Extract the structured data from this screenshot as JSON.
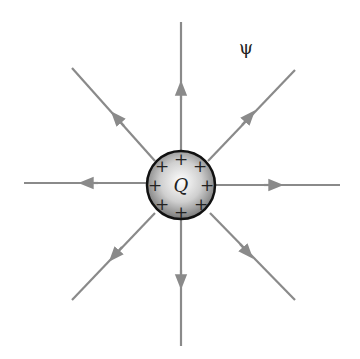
{
  "diagram": {
    "title": "",
    "flux_label": "ψ",
    "charge_label": "Q",
    "charge_signs": [
      "+",
      "+",
      "+",
      "+",
      "+",
      "+",
      "+",
      "+"
    ],
    "colors": {
      "field_line": "#8a8a8a",
      "sphere_outline": "#111111",
      "sphere_light": "#ffffff",
      "sphere_dark": "#7a7a7a",
      "text": "#222222"
    },
    "field_lines": [
      {
        "direction": "up",
        "arrow": "outward"
      },
      {
        "direction": "up-right",
        "arrow": "outward"
      },
      {
        "direction": "right",
        "arrow": "outward"
      },
      {
        "direction": "down-right",
        "arrow": "outward"
      },
      {
        "direction": "down",
        "arrow": "outward"
      },
      {
        "direction": "down-left",
        "arrow": "outward"
      },
      {
        "direction": "left",
        "arrow": "outward"
      },
      {
        "direction": "up-left",
        "arrow": "outward"
      }
    ]
  }
}
